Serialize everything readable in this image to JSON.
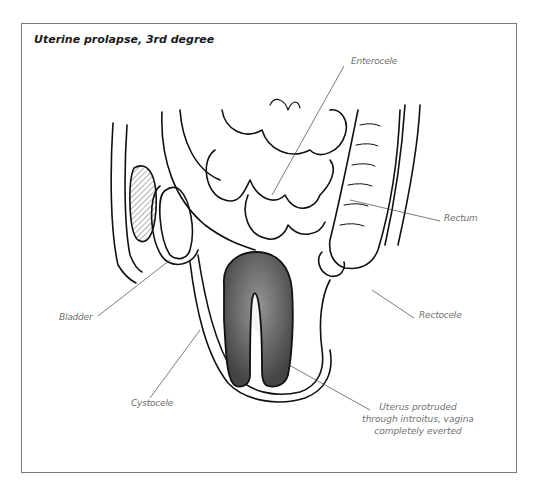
{
  "figure": {
    "title": "Uterine prolapse, 3rd degree",
    "labels": {
      "enterocele": "Enterocele",
      "rectum": "Rectum",
      "rectocele": "Rectocele",
      "bladder": "Bladder",
      "cystocele": "Cystocele",
      "uterus_line1": "Uterus protruded",
      "uterus_line2": "through introitus, vagina",
      "uterus_line3": "completely everted"
    },
    "colors": {
      "frame": "#7a7a7a",
      "ink": "#111111",
      "label": "#6f6f6f"
    }
  }
}
